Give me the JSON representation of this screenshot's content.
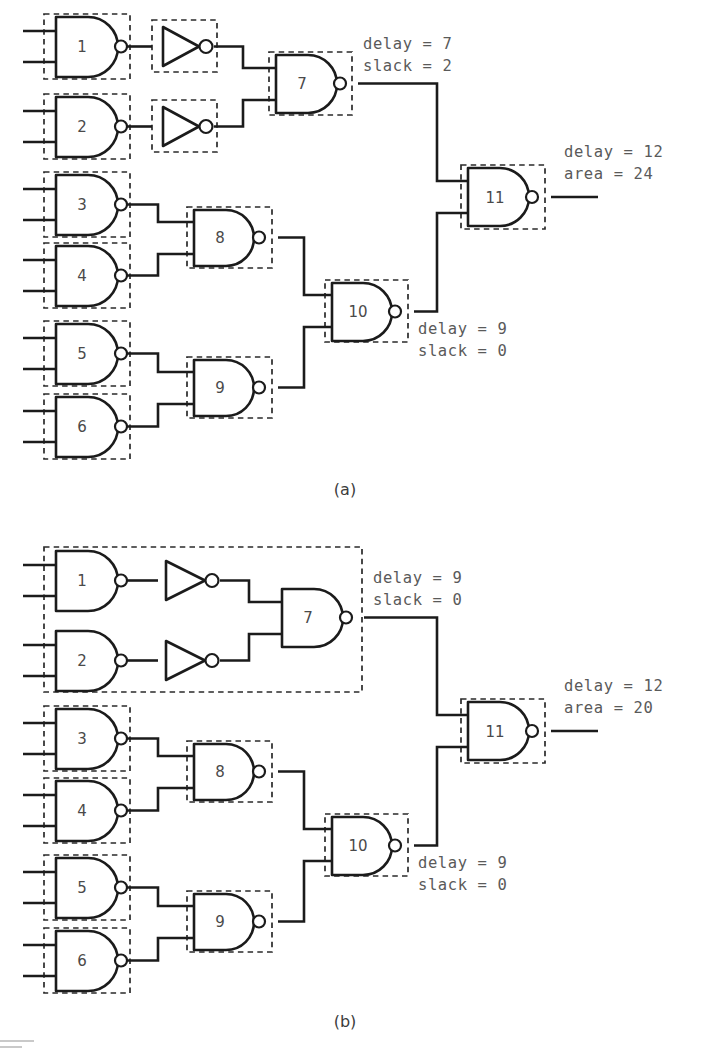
{
  "figure": {
    "type": "logic-circuit-diagram",
    "captions": [
      {
        "id": "caption-a",
        "text": "(a)"
      },
      {
        "id": "caption-b",
        "text": "(b)"
      }
    ]
  },
  "circuit_a": {
    "caption": "(a)",
    "gates": [
      {
        "id": "1",
        "type": "nand",
        "label": "1"
      },
      {
        "id": "2",
        "type": "nand",
        "label": "2"
      },
      {
        "id": "3",
        "type": "nand",
        "label": "3"
      },
      {
        "id": "4",
        "type": "nand",
        "label": "4"
      },
      {
        "id": "5",
        "type": "nand",
        "label": "5"
      },
      {
        "id": "6",
        "type": "nand",
        "label": "6"
      },
      {
        "id": "7",
        "type": "nand",
        "label": "7"
      },
      {
        "id": "8",
        "type": "nand",
        "label": "8"
      },
      {
        "id": "9",
        "type": "nand",
        "label": "9"
      },
      {
        "id": "10",
        "type": "nand",
        "label": "10"
      },
      {
        "id": "11",
        "type": "nand",
        "label": "11"
      },
      {
        "id": "inv-a1",
        "type": "inverter",
        "label": ""
      },
      {
        "id": "inv-a2",
        "type": "inverter",
        "label": ""
      }
    ],
    "annotations": [
      {
        "id": "annot-gate7",
        "line1": "delay = 7",
        "line2": "slack = 2"
      },
      {
        "id": "annot-gate10",
        "line1": "delay = 9",
        "line2": "slack = 0"
      },
      {
        "id": "annot-output",
        "line1": "delay = 12",
        "line2": "area = 24"
      }
    ],
    "cluster_count": 13
  },
  "circuit_b": {
    "caption": "(b)",
    "gates": [
      {
        "id": "1",
        "type": "nand",
        "label": "1"
      },
      {
        "id": "2",
        "type": "nand",
        "label": "2"
      },
      {
        "id": "3",
        "type": "nand",
        "label": "3"
      },
      {
        "id": "4",
        "type": "nand",
        "label": "4"
      },
      {
        "id": "5",
        "type": "nand",
        "label": "5"
      },
      {
        "id": "6",
        "type": "nand",
        "label": "6"
      },
      {
        "id": "7",
        "type": "nand",
        "label": "7"
      },
      {
        "id": "8",
        "type": "nand",
        "label": "8"
      },
      {
        "id": "9",
        "type": "nand",
        "label": "9"
      },
      {
        "id": "10",
        "type": "nand",
        "label": "10"
      },
      {
        "id": "11",
        "type": "nand",
        "label": "11"
      },
      {
        "id": "inv-b1",
        "type": "inverter",
        "label": ""
      },
      {
        "id": "inv-b2",
        "type": "inverter",
        "label": ""
      }
    ],
    "annotations": [
      {
        "id": "annot-gate7",
        "line1": "delay = 9",
        "line2": "slack = 0"
      },
      {
        "id": "annot-gate10",
        "line1": "delay = 9",
        "line2": "slack = 0"
      },
      {
        "id": "annot-output",
        "line1": "delay = 12",
        "line2": "area = 20"
      }
    ],
    "cluster_count": 9
  },
  "colors": {
    "ink": "#1b1b1b",
    "cluster_stroke": "#2a2a2a",
    "annotation_text": "#5a5a5a",
    "gate_label_text": "#4a4a4a",
    "background": "#ffffff"
  }
}
